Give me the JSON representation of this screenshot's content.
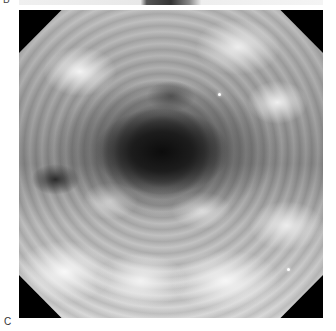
{
  "figure": {
    "previous_panel_label": "B",
    "panel_label": "C",
    "image_description": "Endoscopic grayscale view of a lumen with nodular mucosa, octagonal frame"
  }
}
